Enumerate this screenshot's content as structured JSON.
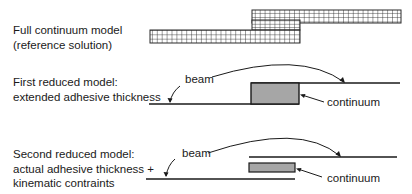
{
  "rows": [
    {
      "id": "full-continuum",
      "label_lines": [
        "Full continuum model",
        "(reference solution)"
      ]
    },
    {
      "id": "first-reduced",
      "label_lines": [
        "First reduced model:",
        "extended adhesive thickness"
      ],
      "annotations": {
        "beam": "beam",
        "continuum": "continuum"
      }
    },
    {
      "id": "second-reduced",
      "label_lines": [
        "Second reduced model:",
        "actual adhesive thickness +",
        "kinematic contraints"
      ],
      "annotations": {
        "beam": "beam",
        "continuum": "continuum"
      }
    }
  ],
  "colors": {
    "line": "#1a1a1a",
    "continuum_fill": "#a6a6a6",
    "mesh_stroke": "#2a2a2a"
  }
}
